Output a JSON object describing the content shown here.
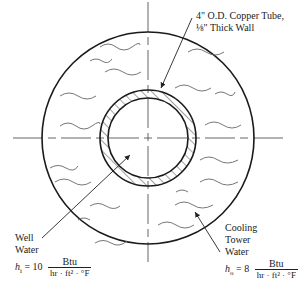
{
  "figure": {
    "type": "cross-section diagram"
  },
  "labels": {
    "tube": {
      "line1": "4\" O.D. Copper Tube,",
      "line2": "⅛\" Thick Wall"
    },
    "well_water": {
      "line1": "Well",
      "line2": "Water",
      "coef_symbol": "h",
      "coef_sub": "i",
      "coef_eq": " = 10",
      "unit_num": "Btu",
      "unit_den": "hr · ft² · °F"
    },
    "cooling_water": {
      "line1": "Cooling",
      "line2": "Tower",
      "line3": "Water",
      "coef_symbol": "h",
      "coef_sub": "o",
      "coef_eq": " = 8",
      "unit_num": "Btu",
      "unit_den": "hr · ft² · °F"
    }
  },
  "geometry": {
    "center": [
      148,
      138
    ],
    "outer_radius": 106,
    "tube_outer_radius": 48,
    "tube_inner_radius": 40
  },
  "colors": {
    "line": "#1a1a1a",
    "wave": "#666666",
    "centerline": "#555555"
  }
}
